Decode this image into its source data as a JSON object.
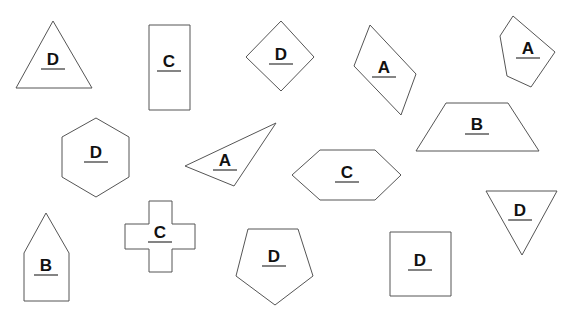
{
  "diagram": {
    "colors": {
      "stroke": "#555555",
      "text": "#111111",
      "background": "#ffffff"
    },
    "shapes": [
      {
        "id": "triangle-1",
        "kind": "triangle",
        "label": "D",
        "points": "53,21 16,88 92,88",
        "lx": 53,
        "ly": 67
      },
      {
        "id": "rectangle-1",
        "kind": "rectangle",
        "label": "C",
        "points": "149,25 190,25 190,110 149,110",
        "lx": 169,
        "ly": 69
      },
      {
        "id": "diamond-1",
        "kind": "rhombus",
        "label": "D",
        "points": "281,21 314,57 281,91 246,57",
        "lx": 281,
        "ly": 62
      },
      {
        "id": "parallelogram-1",
        "kind": "parallelogram",
        "label": "A",
        "points": "370,25 416,74 401,115 354,66",
        "lx": 384,
        "ly": 75
      },
      {
        "id": "pentagon-1",
        "kind": "pentagon",
        "label": "A",
        "points": "513,16 555,52 531,87 507,76 500,36",
        "lx": 528,
        "ly": 56
      },
      {
        "id": "trapezoid-1",
        "kind": "trapezoid",
        "label": "B",
        "points": "446,103 508,103 539,151 416,151",
        "lx": 477,
        "ly": 132
      },
      {
        "id": "hexagon-1",
        "kind": "hexagon",
        "label": "D",
        "points": "96,118 129,137 129,177 96,197 62,177 62,137",
        "lx": 96,
        "ly": 160
      },
      {
        "id": "triangle-2",
        "kind": "triangle",
        "label": "A",
        "points": "185,166 276,123 234,186",
        "lx": 225,
        "ly": 168
      },
      {
        "id": "hexagon-2",
        "kind": "hexagon",
        "label": "C",
        "points": "320,150 375,150 401,175 375,200 320,200 292,175",
        "lx": 347,
        "ly": 180
      },
      {
        "id": "triangle-3",
        "kind": "inverted-triangle",
        "label": "D",
        "points": "486,191 557,191 522,255",
        "lx": 520,
        "ly": 218
      },
      {
        "id": "house-1",
        "kind": "pentagon-house",
        "label": "B",
        "points": "46,213 69,253 69,301 24,301 24,253",
        "lx": 46,
        "ly": 273
      },
      {
        "id": "cross-1",
        "kind": "cross",
        "label": "C",
        "points": "149,201 172,201 172,224 195,224 195,249 172,249 172,272 149,272 149,249 125,249 125,224 149,224",
        "lx": 160,
        "ly": 240
      },
      {
        "id": "pentagon-2",
        "kind": "pentagon",
        "label": "D",
        "points": "248,229 298,229 313,276 275,305 236,276",
        "lx": 274,
        "ly": 264
      },
      {
        "id": "square-1",
        "kind": "square",
        "label": "D",
        "points": "390,232 451,232 451,296 390,296",
        "lx": 420,
        "ly": 268
      }
    ]
  }
}
